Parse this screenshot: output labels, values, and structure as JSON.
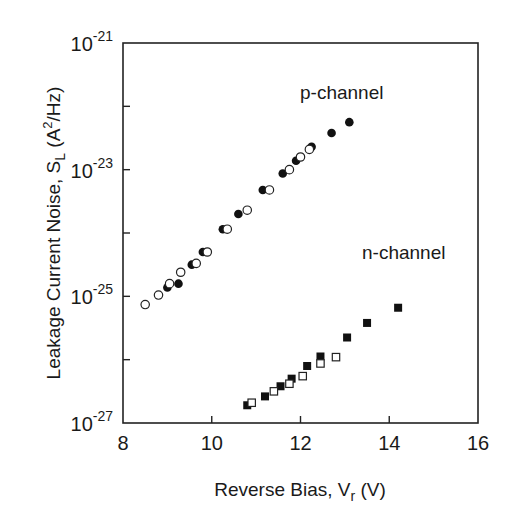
{
  "chart_data": {
    "type": "scatter",
    "title": "",
    "xlabel": "Reverse Bias, V_r (V)",
    "ylabel": "Leakage Current Noise, S_L (A^2/Hz)",
    "xlim": [
      8,
      16
    ],
    "ylim": [
      1e-27,
      1e-21
    ],
    "yscale": "log",
    "x_ticks": [
      "8",
      "10",
      "12",
      "14",
      "16"
    ],
    "y_ticks": [
      "10^-27",
      "10^-25",
      "10^-23",
      "10^-21"
    ],
    "grid": false,
    "annotations": [
      "p-channel",
      "n-channel"
    ],
    "series": [
      {
        "name": "p-channel (filled circles)",
        "marker": "filled-circle",
        "points": [
          [
            9.0,
            -24.86
          ],
          [
            9.25,
            -24.8
          ],
          [
            9.55,
            -24.5
          ],
          [
            9.8,
            -24.3
          ],
          [
            10.25,
            -23.94
          ],
          [
            10.6,
            -23.7
          ],
          [
            11.15,
            -23.32
          ],
          [
            11.6,
            -23.06
          ],
          [
            11.9,
            -22.86
          ],
          [
            12.25,
            -22.64
          ],
          [
            12.7,
            -22.42
          ],
          [
            13.1,
            -22.25
          ]
        ]
      },
      {
        "name": "p-channel (open circles)",
        "marker": "open-circle",
        "points": [
          [
            8.5,
            -25.13
          ],
          [
            8.8,
            -24.98
          ],
          [
            9.05,
            -24.8
          ],
          [
            9.3,
            -24.62
          ],
          [
            9.65,
            -24.48
          ],
          [
            9.9,
            -24.3
          ],
          [
            10.35,
            -23.94
          ],
          [
            10.8,
            -23.64
          ],
          [
            11.3,
            -23.32
          ],
          [
            11.75,
            -23.0
          ],
          [
            12.0,
            -22.8
          ],
          [
            12.2,
            -22.68
          ]
        ]
      },
      {
        "name": "n-channel (filled squares)",
        "marker": "filled-square",
        "points": [
          [
            10.8,
            -26.72
          ],
          [
            11.2,
            -26.58
          ],
          [
            11.55,
            -26.42
          ],
          [
            11.8,
            -26.3
          ],
          [
            12.15,
            -26.1
          ],
          [
            12.45,
            -25.95
          ],
          [
            13.05,
            -25.65
          ],
          [
            13.5,
            -25.42
          ],
          [
            14.2,
            -25.18
          ]
        ]
      },
      {
        "name": "n-channel (open squares)",
        "marker": "open-square",
        "points": [
          [
            10.9,
            -26.68
          ],
          [
            11.4,
            -26.5
          ],
          [
            11.75,
            -26.38
          ],
          [
            12.05,
            -26.26
          ],
          [
            12.45,
            -26.06
          ],
          [
            12.8,
            -25.96
          ]
        ]
      }
    ]
  }
}
